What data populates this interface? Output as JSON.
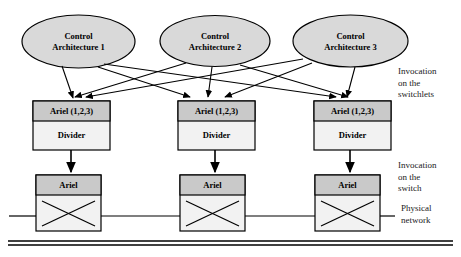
{
  "figure": {
    "colors": {
      "ellipse_fill": "#d9d9d9",
      "header_fill": "#c9c9c9",
      "body_fill": "#f2f2f2",
      "stroke": "#000000",
      "text": "#000000",
      "side_text": "#1a1a1a"
    }
  },
  "controllers": [
    {
      "line1": "Control",
      "line2": "Architecture 1"
    },
    {
      "line1": "Control",
      "line2": "Architecture 2"
    },
    {
      "line1": "Control",
      "line2": "Architecture 3"
    }
  ],
  "switchlets": [
    {
      "header": "Ariel (1,2,3)",
      "body": "Divider"
    },
    {
      "header": "Ariel (1,2,3)",
      "body": "Divider"
    },
    {
      "header": "Ariel (1,2,3)",
      "body": "Divider"
    }
  ],
  "switches": [
    {
      "header": "Ariel"
    },
    {
      "header": "Ariel"
    },
    {
      "header": "Ariel"
    }
  ],
  "annotations": {
    "switchlets": {
      "line1": "Invocation",
      "line2": "on the",
      "line3": "switchlets"
    },
    "switch": {
      "line1": "Invocation",
      "line2": "on the",
      "line3": "switch"
    },
    "network": {
      "line1": "Physical",
      "line2": "network"
    }
  }
}
